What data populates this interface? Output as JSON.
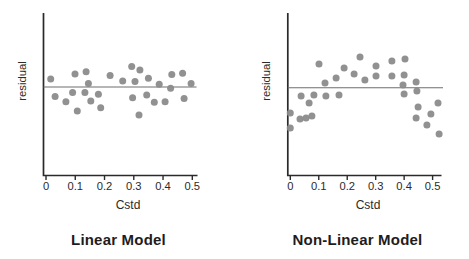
{
  "figure": {
    "background": "#ffffff"
  },
  "colors": {
    "dot": "#8b8b8b",
    "axis": "#2a2a2a",
    "zero_line": "#6e6e6e",
    "text": "#2b2b2b",
    "title": "#1f1c1d"
  },
  "chart_data": [
    {
      "id": "linear-model",
      "type": "scatter",
      "title": "Linear Model",
      "xlabel": "Cstd",
      "ylabel": "residual",
      "xlim": [
        0,
        0.5
      ],
      "ylim": [
        -2.9,
        2.5
      ],
      "x_tick_values": [
        0,
        0.1,
        0.2,
        0.3,
        0.4,
        0.5
      ],
      "x_tick_labels": [
        "0",
        "0.1",
        "0.2",
        "0.3",
        "0.4",
        "0.5"
      ],
      "y_tick_labels": [],
      "grid": false,
      "zero_reference_line": 0,
      "point_format": [
        "Cstd",
        "residual (arbitrary units)"
      ],
      "points": [
        [
          0.016,
          0.27
        ],
        [
          0.031,
          -0.32
        ],
        [
          0.068,
          -0.49
        ],
        [
          0.091,
          -0.18
        ],
        [
          0.099,
          0.43
        ],
        [
          0.107,
          -0.8
        ],
        [
          0.133,
          -0.18
        ],
        [
          0.137,
          0.51
        ],
        [
          0.145,
          0.12
        ],
        [
          0.153,
          -0.47
        ],
        [
          0.179,
          -0.24
        ],
        [
          0.187,
          -0.69
        ],
        [
          0.219,
          0.38
        ],
        [
          0.262,
          0.2
        ],
        [
          0.293,
          0.68
        ],
        [
          0.296,
          -0.36
        ],
        [
          0.304,
          0.18
        ],
        [
          0.318,
          -0.93
        ],
        [
          0.321,
          0.57
        ],
        [
          0.344,
          -0.27
        ],
        [
          0.35,
          0.29
        ],
        [
          0.37,
          -0.51
        ],
        [
          0.387,
          0.09
        ],
        [
          0.407,
          -0.49
        ],
        [
          0.426,
          -0.04
        ],
        [
          0.43,
          0.42
        ],
        [
          0.467,
          0.46
        ],
        [
          0.472,
          -0.38
        ],
        [
          0.496,
          0.12
        ]
      ]
    },
    {
      "id": "non-linear-model",
      "type": "scatter",
      "title": "Non-Linear Model",
      "xlabel": "Cstd",
      "ylabel": "residual",
      "xlim": [
        0,
        0.5
      ],
      "ylim": [
        -2.9,
        2.5
      ],
      "x_tick_values": [
        0,
        0.1,
        0.2,
        0.3,
        0.4,
        0.5
      ],
      "x_tick_labels": [
        "0",
        "0.1",
        "0.2",
        "0.3",
        "0.4",
        "0.5"
      ],
      "y_tick_labels": [],
      "grid": false,
      "zero_reference_line": 0,
      "point_format": [
        "Cstd",
        "residual (arbitrary units)"
      ],
      "points": [
        [
          0.0,
          -0.84
        ],
        [
          0.0,
          -1.34
        ],
        [
          0.034,
          -1.04
        ],
        [
          0.038,
          -0.28
        ],
        [
          0.055,
          -1.01
        ],
        [
          0.066,
          -0.51
        ],
        [
          0.076,
          -0.94
        ],
        [
          0.083,
          -0.24
        ],
        [
          0.101,
          0.79
        ],
        [
          0.122,
          0.16
        ],
        [
          0.125,
          -0.28
        ],
        [
          0.161,
          0.32
        ],
        [
          0.171,
          -0.24
        ],
        [
          0.189,
          0.66
        ],
        [
          0.224,
          0.46
        ],
        [
          0.245,
          1.02
        ],
        [
          0.262,
          0.26
        ],
        [
          0.301,
          0.72
        ],
        [
          0.301,
          0.39
        ],
        [
          0.357,
          0.89
        ],
        [
          0.357,
          0.39
        ],
        [
          0.396,
          0.09
        ],
        [
          0.4,
          0.42
        ],
        [
          0.4,
          -0.21
        ],
        [
          0.403,
          0.96
        ],
        [
          0.442,
          0.19
        ],
        [
          0.442,
          -1.01
        ],
        [
          0.445,
          -0.11
        ],
        [
          0.449,
          -0.64
        ],
        [
          0.48,
          -1.24
        ],
        [
          0.494,
          -0.88
        ],
        [
          0.519,
          -0.51
        ],
        [
          0.523,
          -1.54
        ]
      ]
    }
  ]
}
